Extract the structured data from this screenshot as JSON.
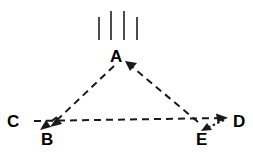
{
  "figure": {
    "background_color": "#ffffff",
    "stroke_color": "#1a1a1a",
    "text_color": "#000000",
    "width": 253,
    "height": 161,
    "labels": {
      "a": "A",
      "b": "B",
      "c": "C",
      "d": "D",
      "e": "E"
    },
    "points": {
      "a": {
        "x": 118,
        "y": 60
      },
      "b": {
        "x": 48,
        "y": 128
      },
      "c": {
        "x": 33,
        "y": 120
      },
      "d": {
        "x": 228,
        "y": 119
      },
      "e": {
        "x": 203,
        "y": 128
      }
    },
    "edges": [
      {
        "name": "edge-a-to-b",
        "from": "A",
        "to": "B",
        "style": "dashed",
        "arrow_at": "B"
      },
      {
        "name": "edge-e-to-a",
        "from": "E",
        "to": "A",
        "style": "dashed",
        "arrow_at": "A"
      },
      {
        "name": "edge-c-to-d",
        "from": "C",
        "to": "D",
        "style": "dashed",
        "arrow_at": "D"
      },
      {
        "name": "edge-c-to-b",
        "from": "C",
        "to": "B",
        "style": "dashed",
        "arrow_at": "B"
      },
      {
        "name": "edge-d-to-e",
        "from": "D",
        "to": "E",
        "style": "dotted",
        "arrow_at": "E"
      }
    ],
    "tick_marks": {
      "name": "vertical-tick-marks",
      "count": 4,
      "color": "#4d4d4d",
      "items": [
        {
          "x": 99,
          "top": 17,
          "bottom": 40
        },
        {
          "x": 111,
          "top": 11,
          "bottom": 40
        },
        {
          "x": 124,
          "top": 11,
          "bottom": 40
        },
        {
          "x": 137,
          "top": 17,
          "bottom": 40
        }
      ]
    }
  }
}
